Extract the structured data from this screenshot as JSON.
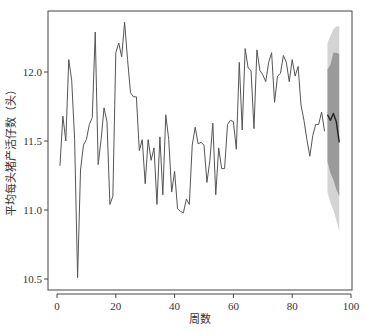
{
  "chart_data": {
    "type": "line",
    "title": "",
    "xlabel": "周数",
    "ylabel": "平均每头猪产活仔数（头）",
    "xlim": [
      0,
      100
    ],
    "ylim": [
      10.5,
      12.35
    ],
    "x_ticks": [
      0,
      20,
      40,
      60,
      80,
      100
    ],
    "y_ticks": [
      10.5,
      11.0,
      11.5,
      12.0
    ],
    "y_tick_labels": [
      "10.5",
      "11.0",
      "11.5",
      "12.0"
    ],
    "grid": false,
    "legend": null,
    "series": [
      {
        "name": "observed",
        "color": "#555555",
        "x": [
          1,
          2,
          3,
          4,
          5,
          6,
          7,
          8,
          9,
          10,
          11,
          12,
          13,
          14,
          15,
          16,
          17,
          18,
          19,
          20,
          21,
          22,
          23,
          24,
          25,
          26,
          27,
          28,
          29,
          30,
          31,
          32,
          33,
          34,
          35,
          36,
          37,
          38,
          39,
          40,
          41,
          42,
          43,
          44,
          45,
          46,
          47,
          48,
          49,
          50,
          51,
          52,
          53,
          54,
          55,
          56,
          57,
          58,
          59,
          60,
          61,
          62,
          63,
          64,
          65,
          66,
          67,
          68,
          69,
          70,
          71,
          72,
          73,
          74,
          75,
          76,
          77,
          78,
          79,
          80,
          81,
          82,
          83,
          84,
          85,
          86,
          87,
          88,
          89,
          90,
          91
        ],
        "values": [
          11.32,
          11.68,
          11.5,
          12.09,
          11.94,
          11.51,
          10.51,
          11.29,
          11.47,
          11.51,
          11.62,
          11.67,
          12.29,
          11.33,
          11.51,
          11.74,
          11.64,
          11.04,
          11.1,
          12.14,
          12.21,
          12.11,
          12.36,
          12.09,
          11.85,
          11.82,
          11.82,
          11.43,
          11.51,
          11.19,
          11.51,
          11.36,
          11.45,
          11.04,
          11.53,
          11.11,
          11.69,
          11.51,
          11.13,
          11.28,
          11.01,
          10.99,
          10.98,
          11.08,
          11.04,
          11.47,
          11.6,
          11.48,
          11.49,
          11.47,
          11.2,
          11.36,
          11.63,
          11.11,
          11.45,
          11.3,
          11.3,
          11.62,
          11.65,
          11.64,
          11.44,
          12.07,
          11.58,
          12.17,
          12.03,
          12.01,
          11.59,
          12.16,
          12.01,
          11.98,
          11.93,
          12.07,
          12.14,
          11.78,
          11.97,
          11.99,
          12.12,
          12.07,
          11.93,
          12.09,
          11.97,
          12.04,
          11.76,
          11.65,
          11.51,
          11.39,
          11.54,
          11.62,
          11.62,
          11.71,
          11.57
        ]
      },
      {
        "name": "forecast",
        "color": "#222222",
        "x": [
          92,
          93,
          94,
          95,
          96
        ],
        "values": [
          11.69,
          11.65,
          11.7,
          11.64,
          11.49
        ]
      }
    ],
    "bands": [
      {
        "name": "95% interval",
        "color": "#d4d4d4",
        "x": [
          92,
          93,
          94,
          95,
          96
        ],
        "upper": [
          12.21,
          12.26,
          12.31,
          12.33,
          12.33
        ],
        "lower": [
          11.13,
          11.05,
          11.0,
          10.93,
          10.84
        ]
      },
      {
        "name": "80% interval",
        "color": "#9a9a9a",
        "x": [
          92,
          93,
          94,
          95,
          96
        ],
        "upper": [
          12.02,
          12.05,
          12.14,
          12.14,
          12.13
        ],
        "lower": [
          11.35,
          11.27,
          11.22,
          11.15,
          11.1
        ]
      }
    ]
  },
  "caption": "　"
}
